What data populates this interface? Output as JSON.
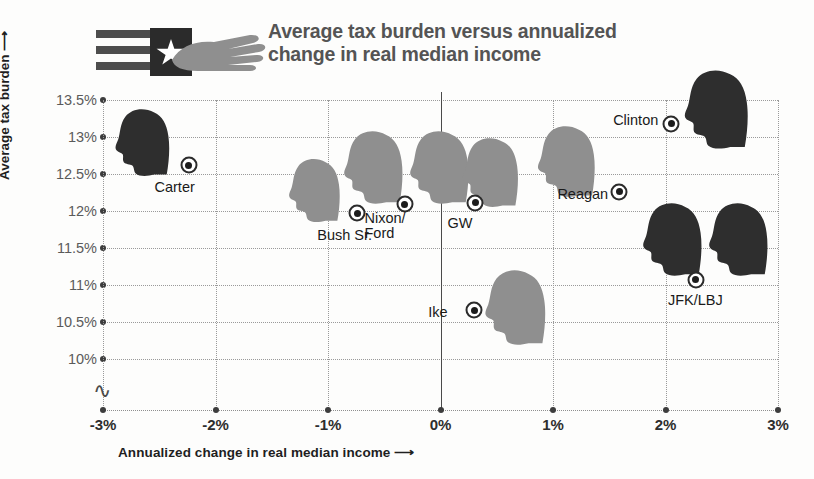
{
  "header": {
    "title": "Average tax burden versus annualized change in real median income",
    "logo_name": "flag-and-hand-logo"
  },
  "chart_data": {
    "type": "scatter",
    "title": "Average tax burden versus annualized change in real median income",
    "xlabel": "Annualized change in real median income ⟶",
    "ylabel": "Average tax burden ⟶",
    "xlim": [
      -3,
      3
    ],
    "ylim": [
      9.75,
      13.5
    ],
    "grid": true,
    "legend": "none",
    "xtick_labels": [
      "-3%",
      "-2%",
      "-1%",
      "0%",
      "1%",
      "2%",
      "3%"
    ],
    "xticks": [
      -3,
      -2,
      -1,
      0,
      1,
      2,
      3
    ],
    "ytick_labels": [
      "13.5%",
      "13%",
      "12.5%",
      "12%",
      "11.5%",
      "11%",
      "10.5%",
      "10%"
    ],
    "yticks": [
      13.5,
      13,
      12.5,
      12,
      11.5,
      11,
      10.5,
      10
    ],
    "y_axis_break": true,
    "points": [
      {
        "label": "Carter",
        "x": -2.24,
        "y": 12.62,
        "tone": "dark",
        "label_dx": -34,
        "label_dy": 22,
        "head_dx": -46,
        "head_dy": -22,
        "head_w": 74,
        "head_h": 70,
        "heads": 1
      },
      {
        "label": "Bush Sr.",
        "x": -0.74,
        "y": 11.97,
        "tone": "light",
        "label_dx": -40,
        "label_dy": 22,
        "head_dx": -42,
        "head_dy": -22,
        "head_w": 68,
        "head_h": 66,
        "heads": 1
      },
      {
        "label": "Nixon/\nFord",
        "x": -0.32,
        "y": 12.09,
        "tone": "light",
        "label_dx": -40,
        "label_dy": 22,
        "head_dx": 2,
        "head_dy": -36,
        "head_w": 72,
        "head_h": 76,
        "heads": 2
      },
      {
        "label": "GW",
        "x": 0.31,
        "y": 12.11,
        "tone": "light",
        "label_dx": -28,
        "label_dy": 20,
        "head_dx": 16,
        "head_dy": -30,
        "head_w": 70,
        "head_h": 72,
        "heads": 1
      },
      {
        "label": "Ike",
        "x": 0.3,
        "y": 10.66,
        "tone": "light",
        "label_dx": -46,
        "label_dy": 2,
        "head_dx": 42,
        "head_dy": -2,
        "head_w": 72,
        "head_h": 78,
        "heads": 1
      },
      {
        "label": "Reagan",
        "x": 1.59,
        "y": 12.26,
        "tone": "light",
        "label_dx": -62,
        "label_dy": 2,
        "head_dx": -52,
        "head_dy": -30,
        "head_w": 74,
        "head_h": 74,
        "heads": 1
      },
      {
        "label": "Clinton",
        "x": 2.05,
        "y": 13.18,
        "tone": "dark",
        "label_dx": -58,
        "label_dy": -4,
        "head_dx": 46,
        "head_dy": -14,
        "head_w": 82,
        "head_h": 82,
        "heads": 1
      },
      {
        "label": "JFK/LBJ",
        "x": 2.27,
        "y": 11.07,
        "tone": "dark",
        "label_dx": -28,
        "label_dy": 20,
        "head_dx": 10,
        "head_dy": -40,
        "head_w": 72,
        "head_h": 76,
        "heads": 2
      }
    ]
  },
  "colors": {
    "head_dark": "#2e2e2e",
    "head_light": "#8f8f8f",
    "grid": "#9a9a9a",
    "axis": "#4a4a4a",
    "title": "#545454",
    "flag_stripe": "#4d4d4d",
    "hand": "#8f8f8f"
  }
}
